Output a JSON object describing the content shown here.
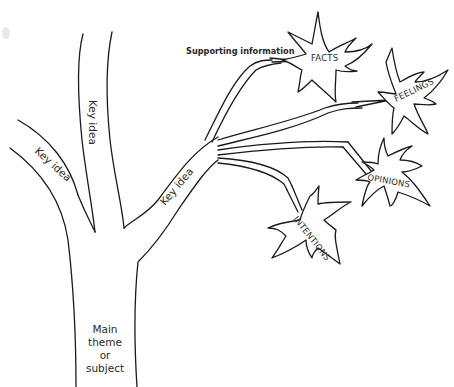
{
  "diagram": {
    "type": "tree-graphic-organizer",
    "trunk": {
      "label_lines": [
        "Main",
        "theme",
        "or",
        "subject"
      ]
    },
    "branches": [
      {
        "id": "left-branch",
        "label": "Key idea"
      },
      {
        "id": "center-branch",
        "label": "Key idea"
      },
      {
        "id": "right-branch",
        "label": "Key idea"
      }
    ],
    "supporting_label": "Supporting information",
    "leaves": [
      {
        "id": "facts",
        "label": "FACTS"
      },
      {
        "id": "feelings",
        "label": "FEELINGS"
      },
      {
        "id": "opinions",
        "label": "OPINIONS"
      },
      {
        "id": "intentions",
        "label": "INTENTIONS"
      }
    ],
    "colors": {
      "line": "#1a1a1a",
      "text": "#2a2a2a",
      "background": "#ffffff"
    }
  }
}
